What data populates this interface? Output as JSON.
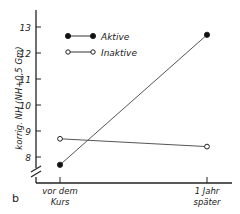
{
  "panel_label": "b",
  "chart_data": {
    "type": "line",
    "title": "",
    "xlabel": "",
    "ylabel": "korrig. NH (NH+0,5 Gm)",
    "categories": [
      "vor dem Kurs",
      "1 Jahr später"
    ],
    "category_lines": [
      [
        "vor dem",
        "Kurs"
      ],
      [
        "1 Jahr",
        "später"
      ]
    ],
    "yticks": [
      8,
      9,
      10,
      11,
      12,
      13
    ],
    "ylim": [
      7.5,
      13.5
    ],
    "y_axis_break": true,
    "grid": false,
    "legend_position": "upper left",
    "series": [
      {
        "name": "Aktive",
        "marker": "filled-circle",
        "values": [
          7.7,
          12.7
        ]
      },
      {
        "name": "Inaktive",
        "marker": "open-circle",
        "values": [
          8.7,
          8.4
        ]
      }
    ]
  },
  "colors": {
    "ink": "#222222",
    "line": "#555555",
    "background": "#ffffff"
  }
}
